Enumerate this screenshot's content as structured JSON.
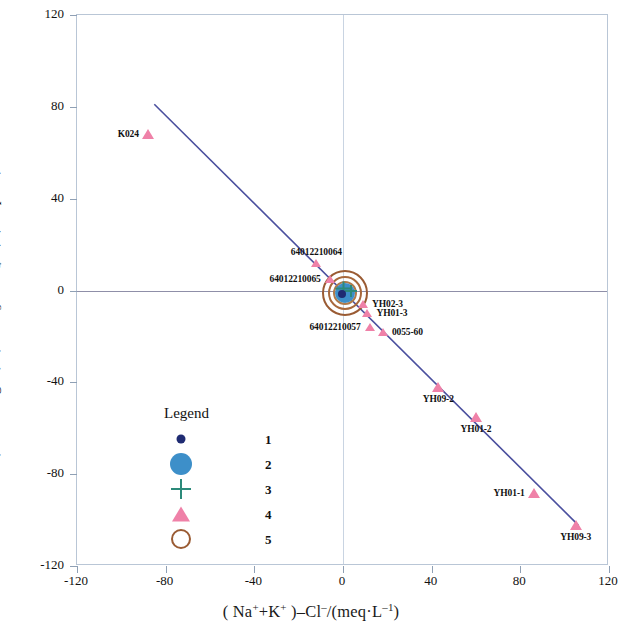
{
  "chart_data": {
    "type": "scatter",
    "title": "",
    "xlabel": "(Na⁺+K⁺)−Cl⁻/(meq·L⁻¹)",
    "ylabel": "(Ca²⁺+Mg²⁺)−(HCO₃⁻+SO₄²⁻)/(meq·L⁻¹)",
    "xlim": [
      -120,
      120
    ],
    "ylim": [
      -120,
      120
    ],
    "xticks": [
      -120,
      -80,
      -40,
      0,
      40,
      80,
      120
    ],
    "yticks": [
      120,
      80,
      40,
      0,
      -40,
      -80,
      -120
    ],
    "grid": false,
    "legend_position": "inside-lower-left",
    "trend_line": {
      "x": [
        -85,
        107
      ],
      "y": [
        81,
        -103
      ],
      "color": "#4a4f9e",
      "slope": -0.958,
      "intercept": -0.45
    },
    "points": [
      {
        "label": "K024",
        "x": -88,
        "y": 68,
        "marker": "triangle",
        "label_pos": "left"
      },
      {
        "label": "64012210064",
        "x": -12,
        "y": 12,
        "marker": "triangle",
        "label_pos": "above"
      },
      {
        "label": "64012210065",
        "x": -6,
        "y": 5,
        "marker": "triangle",
        "label_pos": "left"
      },
      {
        "label": "YH02-3",
        "x": 9,
        "y": -6,
        "marker": "triangle",
        "label_pos": "right"
      },
      {
        "label": "YH01-3",
        "x": 11,
        "y": -10,
        "marker": "triangle",
        "label_pos": "right"
      },
      {
        "label": "64012210057",
        "x": 12,
        "y": -16,
        "marker": "triangle",
        "label_pos": "left"
      },
      {
        "label": "0055-60",
        "x": 18,
        "y": -18,
        "marker": "triangle",
        "label_pos": "right"
      },
      {
        "label": "YH09-2",
        "x": 43,
        "y": -42,
        "marker": "triangle",
        "label_pos": "below"
      },
      {
        "label": "YH01-2",
        "x": 60,
        "y": -55,
        "marker": "triangle",
        "label_pos": "below"
      },
      {
        "label": "YH01-1",
        "x": 86,
        "y": -88,
        "marker": "triangle",
        "label_pos": "left"
      },
      {
        "label": "YH09-3",
        "x": 105,
        "y": -102,
        "marker": "triangle",
        "label_pos": "below"
      }
    ],
    "cluster": {
      "x": 1,
      "y": -1,
      "note": "overlapping markers at origin",
      "rings": [
        {
          "radius_px": 23,
          "color": "#9a5b33"
        },
        {
          "radius_px": 17,
          "color": "#a8683c"
        },
        {
          "radius_px": 12,
          "color": "#b07a4a"
        }
      ],
      "blue_circle_radius_px": 10,
      "cross_size_px": 15,
      "dark_dot_radius_px": 4
    }
  },
  "legend": {
    "title": "Legend",
    "items": [
      {
        "symbol": "dark-dot",
        "label": "1",
        "color": "#1f2b72"
      },
      {
        "symbol": "filled-circle",
        "label": "2",
        "color": "#3d8fc9"
      },
      {
        "symbol": "cross",
        "label": "3",
        "color": "#2c8a7a"
      },
      {
        "symbol": "triangle",
        "label": "4",
        "color": "#ef81a8"
      },
      {
        "symbol": "open-circle",
        "label": "5",
        "color": "#9a5b33"
      }
    ]
  },
  "axis": {
    "x_tick_labels": [
      "-120",
      "-80",
      "-40",
      "0",
      "40",
      "80",
      "120"
    ],
    "y_tick_labels": [
      "120",
      "80",
      "40",
      "0",
      "-40",
      "-80",
      "-120"
    ]
  }
}
